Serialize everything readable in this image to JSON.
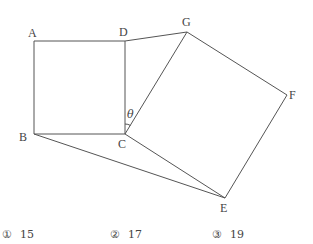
{
  "diagram": {
    "points": {
      "A": {
        "label": "A",
        "x": 34,
        "y": 41
      },
      "B": {
        "label": "B",
        "x": 34,
        "y": 134
      },
      "C": {
        "label": "C",
        "x": 125,
        "y": 134
      },
      "D": {
        "label": "D",
        "x": 125,
        "y": 41
      },
      "G": {
        "label": "G",
        "x": 187,
        "y": 32
      },
      "F": {
        "label": "F",
        "x": 287,
        "y": 95
      },
      "E": {
        "label": "E",
        "x": 225,
        "y": 198
      }
    },
    "angle_label": "θ",
    "line_color": "#555555"
  },
  "choices": [
    {
      "marker": "①",
      "value": "15"
    },
    {
      "marker": "②",
      "value": "17"
    },
    {
      "marker": "③",
      "value": "19"
    }
  ]
}
